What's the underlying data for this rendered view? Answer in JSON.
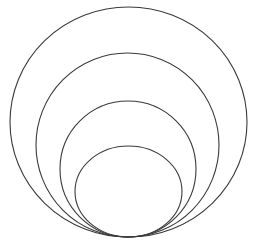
{
  "diagram": {
    "type": "nested-tangent-ellipses",
    "ring_count": 4,
    "rings": [
      {
        "name": "outer-ring",
        "order": 1
      },
      {
        "name": "second-ring",
        "order": 2
      },
      {
        "name": "third-ring",
        "order": 3
      },
      {
        "name": "inner-ring",
        "order": 4
      }
    ],
    "colors": {
      "stroke": "#3a3a3a",
      "background": "#ffffff"
    }
  }
}
